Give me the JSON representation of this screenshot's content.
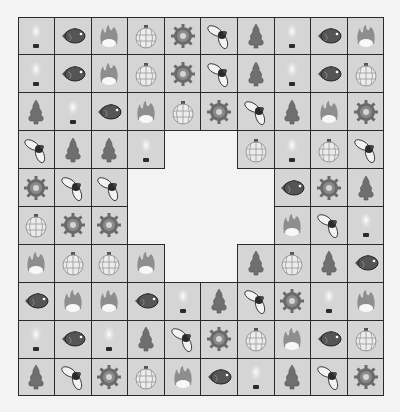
{
  "game": {
    "type": "tile-matching connect puzzle",
    "rows": 10,
    "cols": 10,
    "colors": {
      "background": "#f3f3f3",
      "tile": "#d5d5d5",
      "grid_line": "#2a2a2a"
    },
    "icon_legend": {
      "bulb": "light-bulb-icon",
      "fish": "fish-icon",
      "fire": "flame-icon",
      "lantern": "lantern-ornament-icon",
      "gear": "gear-icon",
      "fly": "fly-insect-icon",
      "tree": "pine-tree-icon",
      "empty": "removed-tile"
    },
    "board": [
      [
        "bulb",
        "fish",
        "fire",
        "lantern",
        "gear",
        "fly",
        "tree",
        "bulb",
        "fish",
        "fire"
      ],
      [
        "bulb",
        "fish",
        "fire",
        "lantern",
        "gear",
        "fly",
        "tree",
        "bulb",
        "fish",
        "lantern"
      ],
      [
        "tree",
        "bulb",
        "fish",
        "fire",
        "lantern",
        "gear",
        "fly",
        "tree",
        "fire",
        "gear"
      ],
      [
        "fly",
        "tree",
        "tree",
        "bulb",
        "empty",
        "empty",
        "lantern",
        "bulb",
        "lantern",
        "fly"
      ],
      [
        "gear",
        "fly",
        "fly",
        "empty",
        "empty",
        "empty",
        "empty",
        "fish",
        "gear",
        "tree"
      ],
      [
        "lantern",
        "gear",
        "gear",
        "empty",
        "empty",
        "empty",
        "empty",
        "fire",
        "fly",
        "bulb"
      ],
      [
        "fire",
        "lantern",
        "lantern",
        "fire",
        "empty",
        "empty",
        "tree",
        "lantern",
        "tree",
        "fish"
      ],
      [
        "fish",
        "fire",
        "fire",
        "fish",
        "bulb",
        "tree",
        "fly",
        "gear",
        "bulb",
        "fire"
      ],
      [
        "bulb",
        "fish",
        "bulb",
        "tree",
        "fly",
        "gear",
        "lantern",
        "fire",
        "fish",
        "lantern"
      ],
      [
        "tree",
        "fly",
        "gear",
        "lantern",
        "fire",
        "fish",
        "bulb",
        "tree",
        "fly",
        "gear"
      ]
    ]
  }
}
